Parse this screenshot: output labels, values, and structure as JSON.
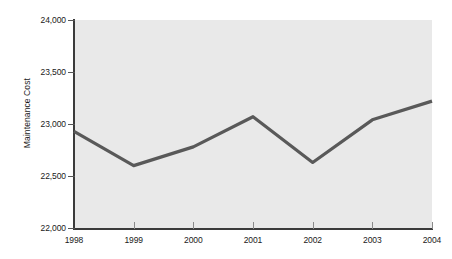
{
  "chart_data": {
    "type": "line",
    "title": "",
    "xlabel": "",
    "ylabel": "Maintenance Cost",
    "categories": [
      "1998",
      "1999",
      "2000",
      "2001",
      "2002",
      "2003",
      "2004"
    ],
    "x": [
      1998,
      1999,
      2000,
      2001,
      2002,
      2003,
      2004
    ],
    "values": [
      22930,
      22600,
      22780,
      23070,
      22630,
      23040,
      23220
    ],
    "series": [
      {
        "name": "Maintenance Cost",
        "values": [
          22930,
          22600,
          22780,
          23070,
          22630,
          23040,
          23220
        ]
      }
    ],
    "ylim": [
      22000,
      24000
    ],
    "yticks": [
      22000,
      22500,
      23000,
      23500,
      24000
    ],
    "ytick_labels": [
      "22,000",
      "22,500",
      "23,000",
      "23,500",
      "24,000"
    ],
    "xtick_labels": [
      "1998",
      "1999",
      "2000",
      "2001",
      "2002",
      "2003",
      "2004"
    ],
    "grid": false,
    "legend": "none",
    "line_color": "#595959",
    "plot_background": "#e9e9e9",
    "axis_color": "#3b3b3b",
    "figure_background": "#ffffff"
  },
  "axes": {
    "y_title": "Maintenance Cost",
    "y_ticks": [
      {
        "label": "24,000",
        "value": 24000
      },
      {
        "label": "23,500",
        "value": 23500
      },
      {
        "label": "23,000",
        "value": 23000
      },
      {
        "label": "22,500",
        "value": 22500
      },
      {
        "label": "22,000",
        "value": 22000
      }
    ],
    "x_ticks": [
      {
        "label": "1998",
        "value": 1998
      },
      {
        "label": "1999",
        "value": 1999
      },
      {
        "label": "2000",
        "value": 2000
      },
      {
        "label": "2001",
        "value": 2001
      },
      {
        "label": "2002",
        "value": 2002
      },
      {
        "label": "2003",
        "value": 2003
      },
      {
        "label": "2004",
        "value": 2004
      }
    ]
  }
}
